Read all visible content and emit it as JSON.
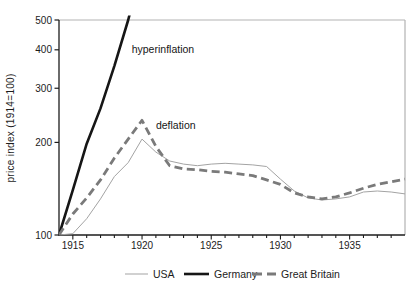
{
  "figure": {
    "background": "#ffffff",
    "frame_color": "#b3b3b3",
    "axis_color": "#1c1c1c"
  },
  "chart_data": {
    "type": "line",
    "title": "",
    "xlabel": "",
    "ylabel": "price index (1914=100)",
    "y_scale": "log",
    "ylim": [
      100,
      500
    ],
    "xlim": [
      1914,
      1939
    ],
    "grid": false,
    "yticks": [
      "100",
      "200",
      "300",
      "400",
      "500"
    ],
    "xticks_labeled": [
      "1915",
      "1920",
      "1925",
      "1930",
      "1935"
    ],
    "xticks_minor_every_year": true,
    "legend_position": "bottom-center",
    "series": [
      {
        "name": "USA",
        "color": "#a3a3a3",
        "width": 1,
        "dash": "",
        "points": [
          [
            1914,
            100
          ],
          [
            1915,
            101
          ],
          [
            1916,
            113
          ],
          [
            1917,
            131
          ],
          [
            1918,
            155
          ],
          [
            1919,
            172
          ],
          [
            1920,
            205
          ],
          [
            1921,
            186
          ],
          [
            1922,
            174
          ],
          [
            1923,
            170
          ],
          [
            1924,
            168
          ],
          [
            1925,
            170
          ],
          [
            1926,
            171
          ],
          [
            1927,
            170
          ],
          [
            1928,
            169
          ],
          [
            1929,
            167
          ],
          [
            1930,
            152
          ],
          [
            1931,
            139
          ],
          [
            1932,
            132
          ],
          [
            1933,
            130
          ],
          [
            1934,
            131
          ],
          [
            1935,
            133
          ],
          [
            1936,
            138
          ],
          [
            1937,
            139
          ],
          [
            1938,
            138
          ],
          [
            1939,
            136
          ]
        ]
      },
      {
        "name": "Germany",
        "color": "#161616",
        "width": 2.6,
        "dash": "",
        "points": [
          [
            1914,
            100
          ],
          [
            1915,
            140
          ],
          [
            1916,
            198
          ],
          [
            1917,
            258
          ],
          [
            1918,
            355
          ],
          [
            1919,
            500
          ],
          [
            1919.3,
            565
          ]
        ]
      },
      {
        "name": "Great Britain",
        "color": "#7a7a7a",
        "width": 2.8,
        "dash": "8 4.5",
        "points": [
          [
            1914,
            100
          ],
          [
            1915,
            117
          ],
          [
            1916,
            132
          ],
          [
            1917,
            151
          ],
          [
            1918,
            178
          ],
          [
            1919,
            205
          ],
          [
            1920,
            236
          ],
          [
            1921,
            194
          ],
          [
            1922,
            168
          ],
          [
            1923,
            164
          ],
          [
            1924,
            163
          ],
          [
            1925,
            161
          ],
          [
            1926,
            160
          ],
          [
            1927,
            158
          ],
          [
            1928,
            156
          ],
          [
            1929,
            151
          ],
          [
            1930,
            146
          ],
          [
            1931,
            137
          ],
          [
            1932,
            133
          ],
          [
            1933,
            131
          ],
          [
            1934,
            133
          ],
          [
            1935,
            137
          ],
          [
            1936,
            142
          ],
          [
            1937,
            146
          ],
          [
            1938,
            149
          ],
          [
            1939,
            152
          ]
        ]
      }
    ],
    "annotations": [
      {
        "text": "hyperinflation",
        "year": 1919.25,
        "value": 390
      },
      {
        "text": "deflation",
        "year": 1921.0,
        "value": 221
      }
    ]
  }
}
